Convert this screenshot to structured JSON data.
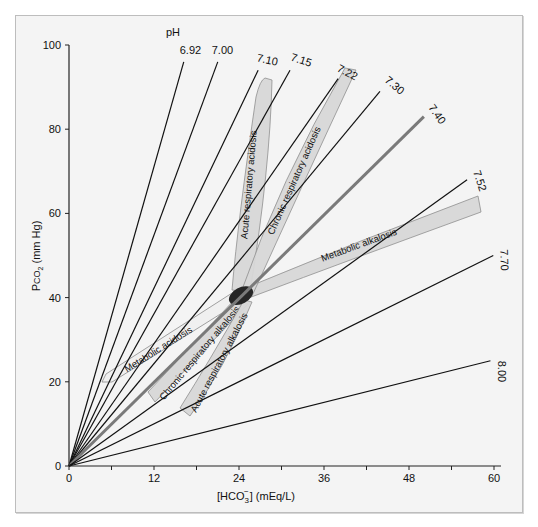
{
  "chart_data": {
    "type": "line",
    "title": "",
    "xlabel": "[HCO3-] (mEq/L)",
    "ylabel": "PCO2 (mm Hg)",
    "xlim": [
      0,
      60
    ],
    "ylim": [
      0,
      100
    ],
    "x_ticks": [
      0,
      12,
      24,
      36,
      48,
      60
    ],
    "y_ticks": [
      0,
      20,
      40,
      60,
      80,
      100
    ],
    "grid": false,
    "isopleth_prefix": "pH",
    "series": [
      {
        "name": "6.92",
        "x": [
          0,
          16.2
        ],
        "y": [
          0,
          96
        ]
      },
      {
        "name": "7.00",
        "x": [
          0,
          21.0
        ],
        "y": [
          0,
          96
        ]
      },
      {
        "name": "7.10",
        "x": [
          0,
          26.7
        ],
        "y": [
          0,
          94
        ]
      },
      {
        "name": "7.15",
        "x": [
          0,
          31.2
        ],
        "y": [
          0,
          94
        ]
      },
      {
        "name": "7.22",
        "x": [
          0,
          38.0
        ],
        "y": [
          0,
          92
        ]
      },
      {
        "name": "7.30",
        "x": [
          0,
          43.9
        ],
        "y": [
          0,
          89
        ]
      },
      {
        "name": "7.40",
        "x": [
          0,
          50.1
        ],
        "y": [
          0,
          83
        ]
      },
      {
        "name": "7.52",
        "x": [
          0,
          56.2
        ],
        "y": [
          0,
          68
        ]
      },
      {
        "name": "7.70",
        "x": [
          0,
          59.9
        ],
        "y": [
          0,
          50
        ]
      },
      {
        "name": "8.00",
        "x": [
          0,
          59.5
        ],
        "y": [
          0,
          25
        ]
      }
    ],
    "regions": [
      {
        "name": "Acute respiratory acidosis",
        "from": [
          24,
          40
        ],
        "to": [
          26,
          91
        ]
      },
      {
        "name": "Chronic respiratory acidosis",
        "from": [
          24,
          40
        ],
        "to": [
          38.5,
          94
        ]
      },
      {
        "name": "Metabolic alkalosis",
        "from": [
          24,
          40
        ],
        "to": [
          58,
          64
        ]
      },
      {
        "name": "Metabolic acidosis",
        "from": [
          24,
          40
        ],
        "to": [
          6,
          21
        ]
      },
      {
        "name": "Chronic respiratory alkalosis",
        "from": [
          24,
          40
        ],
        "to": [
          12,
          17
        ]
      },
      {
        "name": "Acute respiratory alkalosis",
        "from": [
          24,
          40
        ],
        "to": [
          17,
          12
        ]
      }
    ],
    "normal_point": {
      "x": 24,
      "y": 40,
      "label": "normal"
    }
  },
  "labels": {
    "x_axis": "[HCO",
    "x_axis_sub": "3",
    "x_axis_sup": "−",
    "x_axis_tail": "] (mEq/L)",
    "y_axis_p": "P",
    "y_axis_co": "CO",
    "y_axis_sub": "2",
    "y_axis_tail": " (mm Hg)",
    "ph_prefix": "pH"
  },
  "colors": {
    "background": "#f4f4f4",
    "lines": "#111111",
    "line_740": "#7a7a7a",
    "band_fill": "#d8d8d8",
    "band_stroke": "#8a8a8a",
    "ellipse": "#262626"
  }
}
